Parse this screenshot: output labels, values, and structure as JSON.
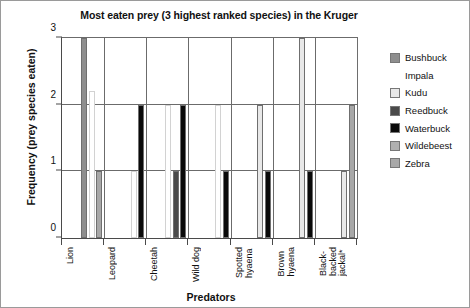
{
  "chart_data": {
    "type": "bar",
    "title": "Most eaten prey (3 highest ranked species) in the Kruger",
    "xlabel": "Predators",
    "ylabel": "Frequency (prey species eaten)",
    "categories": [
      "Lion",
      "Leopard",
      "Cheetah",
      "Wild dog",
      "Spotted\nhyaena",
      "Brown\nhyaena",
      "Black-\nbacked\njackal*"
    ],
    "ylim": [
      0,
      3
    ],
    "yticks": [
      "0",
      "1",
      "2",
      "3"
    ],
    "grid": true,
    "legend_position": "right",
    "series": [
      {
        "name": "Bushbuck",
        "color": "#8e8e8e",
        "values": [
          3,
          0,
          0,
          0,
          0,
          0,
          0
        ]
      },
      {
        "name": "Impala",
        "color": "#ffffff",
        "values": [
          2.2,
          1,
          2,
          2,
          0,
          0,
          0
        ]
      },
      {
        "name": "Kudu",
        "color": "#e8e8e8",
        "values": [
          0,
          0,
          0,
          0,
          2,
          3,
          1
        ]
      },
      {
        "name": "Reedbuck",
        "color": "#4a4a4a",
        "values": [
          0,
          0,
          1,
          0,
          0,
          0,
          0
        ]
      },
      {
        "name": "Waterbuck",
        "color": "#0a0a0a",
        "values": [
          0,
          2,
          2,
          1,
          1,
          1,
          0
        ]
      },
      {
        "name": "Wildebeest",
        "color": "#b0b0b0",
        "values": [
          0,
          0,
          0,
          0,
          0,
          0,
          0
        ]
      },
      {
        "name": "Zebra",
        "color": "#a8a8a8",
        "values": [
          1,
          0,
          0,
          0,
          0,
          0,
          2
        ]
      }
    ]
  }
}
